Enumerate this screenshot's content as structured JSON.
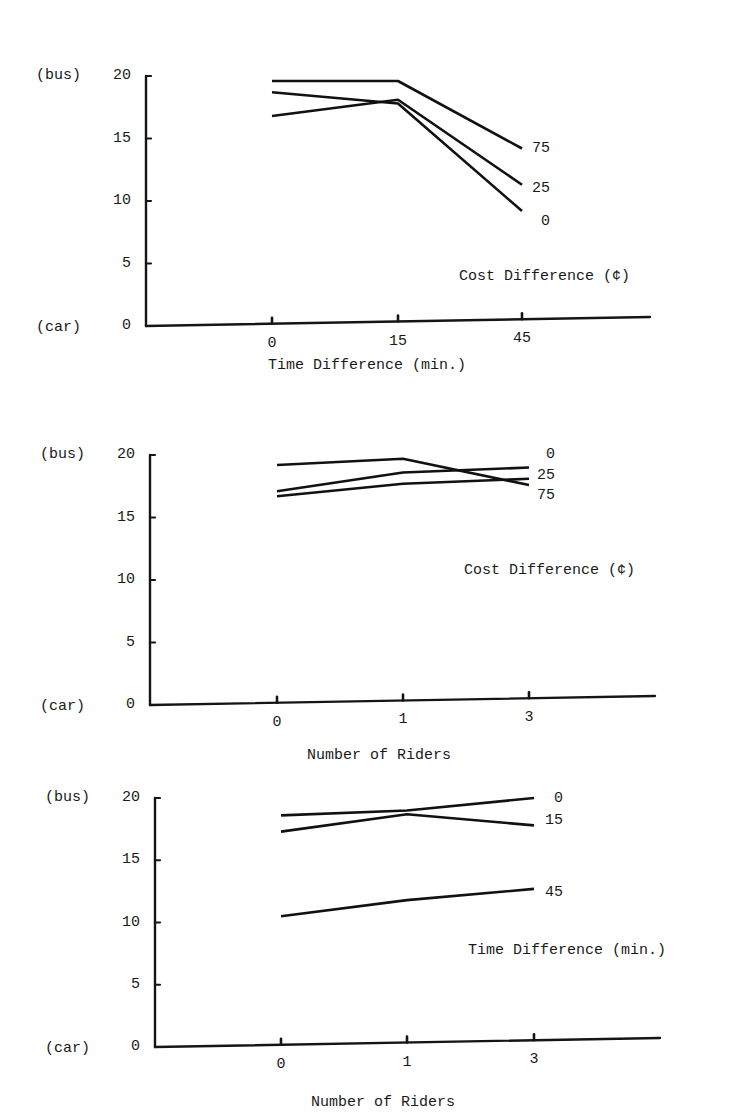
{
  "chart_data": [
    {
      "type": "line",
      "title": "",
      "xlabel": "Time Difference (min.)",
      "ylabel": "",
      "y_top_label": "(bus)",
      "y_bottom_label": "(car)",
      "ylim": [
        0,
        20
      ],
      "yticks": [
        "0",
        "5",
        "10",
        "15",
        "20"
      ],
      "categories": [
        "0",
        "15",
        "45"
      ],
      "legend_title": "Cost Difference (¢)",
      "series": [
        {
          "name": "75",
          "values": [
            19.6,
            19.6,
            14.2
          ]
        },
        {
          "name": "25",
          "values": [
            16.8,
            18.1,
            11.3
          ]
        },
        {
          "name": "0",
          "values": [
            18.7,
            17.8,
            9.2
          ]
        }
      ]
    },
    {
      "type": "line",
      "title": "",
      "xlabel": "Number of Riders",
      "ylabel": "",
      "y_top_label": "(bus)",
      "y_bottom_label": "(car)",
      "ylim": [
        0,
        20
      ],
      "yticks": [
        "0",
        "5",
        "10",
        "15",
        "20"
      ],
      "categories": [
        "0",
        "1",
        "3"
      ],
      "legend_title": "Cost Difference (¢)",
      "series": [
        {
          "name": "0",
          "values": [
            17.1,
            18.6,
            19.0
          ]
        },
        {
          "name": "25",
          "values": [
            16.7,
            17.7,
            18.1
          ]
        },
        {
          "name": "75",
          "values": [
            19.2,
            19.7,
            17.6
          ]
        }
      ]
    },
    {
      "type": "line",
      "title": "",
      "xlabel": "Number of Riders",
      "ylabel": "",
      "y_top_label": "(bus)",
      "y_bottom_label": "(car)",
      "ylim": [
        0,
        20
      ],
      "yticks": [
        "0",
        "5",
        "10",
        "15",
        "20"
      ],
      "categories": [
        "0",
        "1",
        "3"
      ],
      "legend_title": "Time Difference (min.)",
      "series": [
        {
          "name": "0",
          "values": [
            18.6,
            19.0,
            20.0
          ]
        },
        {
          "name": "15",
          "values": [
            17.3,
            18.7,
            17.8
          ]
        },
        {
          "name": "45",
          "values": [
            10.5,
            11.8,
            12.7
          ]
        }
      ]
    }
  ],
  "layout": [
    {
      "top": 76,
      "bottom": 326,
      "axis_x": 146,
      "cat_x": [
        272,
        398,
        522
      ],
      "axis_end_x": 650,
      "end_label_x": 532,
      "series_label_y": [
        149,
        189,
        222
      ],
      "legend_pos": [
        459,
        277
      ],
      "xlabel_pos": [
        268,
        360
      ]
    },
    {
      "top": 455,
      "bottom": 705,
      "axis_x": 150,
      "cat_x": [
        277,
        403,
        529
      ],
      "axis_end_x": 655,
      "end_label_x": 537,
      "series_label_y": [
        455,
        476,
        496
      ],
      "legend_pos": [
        464,
        571
      ],
      "xlabel_pos": [
        307,
        750
      ]
    },
    {
      "top": 798,
      "bottom": 1047,
      "axis_x": 155,
      "cat_x": [
        281,
        407,
        534
      ],
      "axis_end_x": 660,
      "end_label_x": 545,
      "series_label_y": [
        799,
        821,
        893
      ],
      "legend_pos": [
        468,
        951
      ],
      "xlabel_pos": [
        311,
        1097
      ]
    }
  ]
}
